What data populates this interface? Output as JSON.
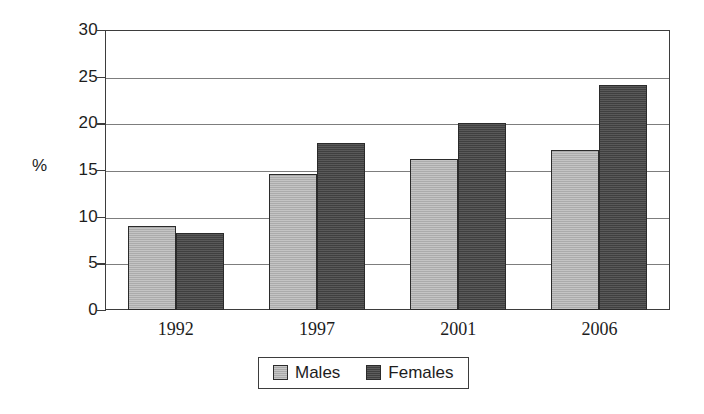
{
  "chart_data": {
    "type": "bar",
    "title": "",
    "subtitle": "",
    "xlabel": "",
    "ylabel": "%",
    "categories": [
      "1992",
      "1997",
      "2001",
      "2006"
    ],
    "series": [
      {
        "name": "Males",
        "color": "#b4b4b4",
        "values": [
          9.0,
          14.6,
          16.2,
          17.1
        ]
      },
      {
        "name": "Females",
        "color": "#474747",
        "values": [
          8.2,
          17.9,
          20.0,
          24.1
        ]
      }
    ],
    "ylim": [
      0,
      30
    ],
    "yticks": [
      0,
      5,
      10,
      15,
      20,
      25,
      30
    ],
    "ytick_labels": [
      "0",
      "5",
      "10",
      "15",
      "20",
      "25",
      "30"
    ],
    "grid": true,
    "grid_axis": "y",
    "legend_position": "bottom-center",
    "legend_entries": [
      "Males",
      "Females"
    ]
  },
  "axes": {
    "y_title": "%"
  },
  "legend": {
    "males_label": "Males",
    "females_label": "Females"
  },
  "colors": {
    "males": "#b4b4b4",
    "females": "#474747",
    "frame": "#3d3d3d",
    "grid": "#7d7d7d",
    "text": "#1d1d1d",
    "background": "#ffffff"
  }
}
